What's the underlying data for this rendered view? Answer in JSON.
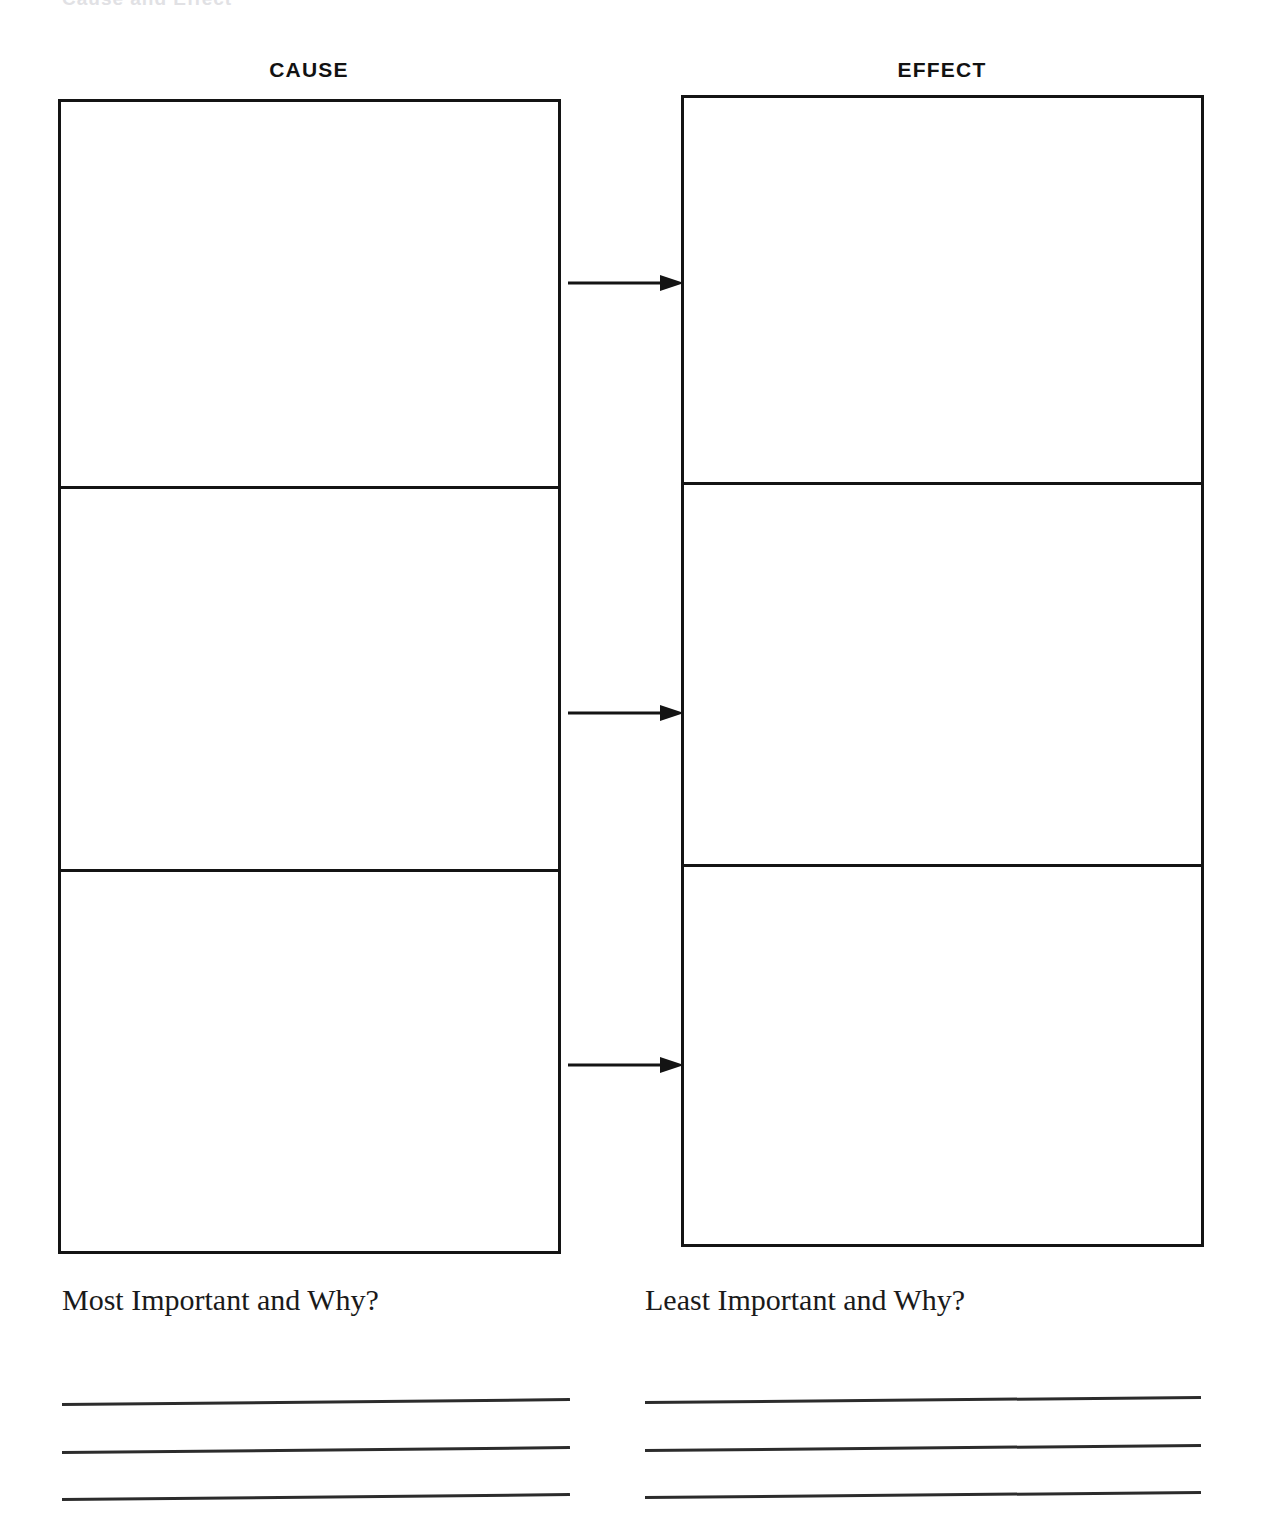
{
  "page": {
    "background_color": "#ffffff",
    "ink_color": "#141414"
  },
  "scan_artifact": {
    "text": "Cause and Effect",
    "note": "faint partially-cropped heading at very top edge"
  },
  "columns": [
    {
      "id": "cause",
      "header": "CAUSE",
      "cells": [
        {
          "index": 1,
          "text": ""
        },
        {
          "index": 2,
          "text": ""
        },
        {
          "index": 3,
          "text": ""
        }
      ]
    },
    {
      "id": "effect",
      "header": "EFFECT",
      "cells": [
        {
          "index": 1,
          "text": ""
        },
        {
          "index": 2,
          "text": ""
        },
        {
          "index": 3,
          "text": ""
        }
      ]
    }
  ],
  "arrows": [
    {
      "id": "arrow-1",
      "from": "cause-cell-1",
      "to": "effect-cell-1",
      "direction": "right"
    },
    {
      "id": "arrow-2",
      "from": "cause-cell-2",
      "to": "effect-cell-2",
      "direction": "right"
    },
    {
      "id": "arrow-3",
      "from": "cause-cell-3",
      "to": "effect-cell-3",
      "direction": "right"
    }
  ],
  "prompts": [
    {
      "id": "most-important",
      "label": "Most Important and Why?",
      "lines": [
        "",
        "",
        ""
      ]
    },
    {
      "id": "least-important",
      "label": "Least Important and Why?",
      "lines": [
        "",
        "",
        ""
      ]
    }
  ]
}
